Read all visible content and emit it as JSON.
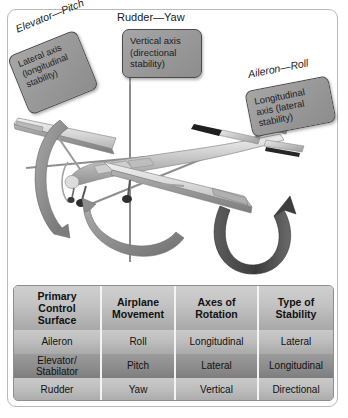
{
  "figure": {
    "callouts": [
      {
        "id": "rudder",
        "title": "Rudder—Yaw",
        "body": "Vertical axis\n(directional\nstability)"
      },
      {
        "id": "elevator",
        "title": "Elevator—Pitch",
        "body": "Lateral axis\n(longitudinal\nstability)"
      },
      {
        "id": "aileron",
        "title": "Aileron—Roll",
        "body": "Longitudinal\naxis (lateral\nstability)"
      }
    ],
    "colors": {
      "callout_fill": "#9a9a9a",
      "callout_border": "#4a4a4a",
      "frame_border": "#b9b9b9",
      "table_header_fill": "#c4c4c4",
      "table_row_light": "#bebebe",
      "table_row_dark": "#8f8f8f",
      "divider": "#f4f4f4",
      "arrow_fill": "#8a8a8a",
      "axis_line": "#8c8c8c"
    }
  },
  "table": {
    "headers": [
      "Primary\nControl\nSurface",
      "Airplane\nMovement",
      "Axes of\nRotation",
      "Type of\nStability"
    ],
    "rows": [
      {
        "shade": "light",
        "cells": [
          "Aileron",
          "Roll",
          "Longitudinal",
          "Lateral"
        ]
      },
      {
        "shade": "dark",
        "cells": [
          "Elevator/\nStabilator",
          "Pitch",
          "Lateral",
          "Longitudinal"
        ]
      },
      {
        "shade": "light",
        "cells": [
          "Rudder",
          "Yaw",
          "Vertical",
          "Directional"
        ]
      }
    ]
  }
}
